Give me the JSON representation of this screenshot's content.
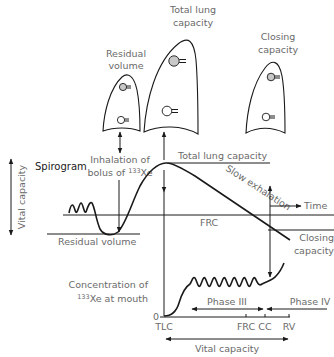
{
  "lungs": {
    "residual_volume": {
      "label_lines": [
        "Residual",
        "volume"
      ]
    },
    "total_lung_capacity": {
      "label_lines": [
        "Total lung",
        "capacity"
      ]
    },
    "closing_capacity": {
      "label_lines": [
        "Closing",
        "capacity"
      ]
    }
  },
  "spirogram": {
    "title": "Spirogram",
    "vital_capacity_axis_label": "Vital capacity",
    "inhalation_label_line1": "Inhalation of",
    "inhalation_label_line2_prefix": "bolus of ",
    "inhalation_label_isotope_mass": "133",
    "inhalation_label_isotope_symbol": "Xe",
    "total_lung_capacity_label": "Total lung capacity",
    "slow_exhalation_label": "Slow exhalation",
    "frc_label": "FRC",
    "residual_volume_label": "Residual volume",
    "time_label": "Time",
    "closing_capacity_lines": [
      "Closing",
      "capacity"
    ]
  },
  "concentration_plot": {
    "ylabel_line1": "Concentration of",
    "ylabel_isotope_mass": "133",
    "ylabel_line2_suffix": "Xe at mouth",
    "zero_label": "0",
    "x_ticks": [
      "TLC",
      "FRC",
      "CC",
      "RV"
    ],
    "phase3_label": "Phase III",
    "phase4_label": "Phase IV",
    "vital_capacity_label": "Vital capacity"
  },
  "colors": {
    "line": "#1a1a1a",
    "label_text": "#6a6a6a",
    "alveolus_fill": "#c8c8c8"
  }
}
